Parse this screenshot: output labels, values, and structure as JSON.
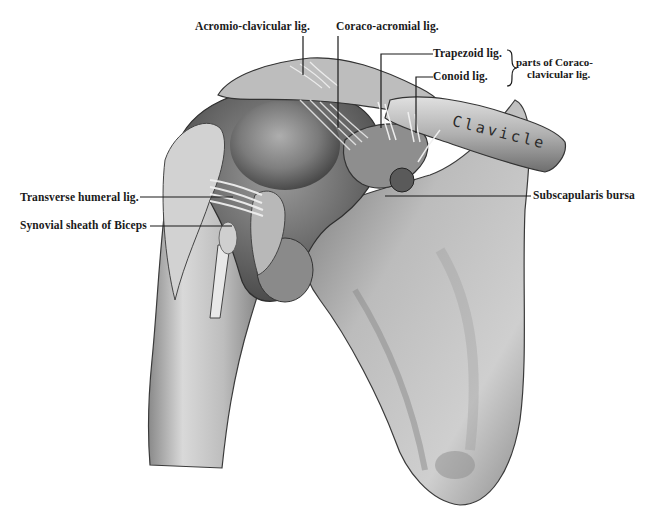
{
  "figure": {
    "colors": {
      "background": "#ffffff",
      "ink": "#1a1a1a",
      "bone_light": "#d8d8d8",
      "bone_mid": "#9a9a9a",
      "bone_dark": "#4a4a4a"
    },
    "labels": {
      "acromio_clavicular": "Acromio-clavicular lig.",
      "coraco_acromial": "Coraco-acromial lig.",
      "trapezoid": "Trapezoid  lig.",
      "conoid": "Conoid lig.",
      "coracoclavicular_line1": "parts of Coraco-",
      "coracoclavicular_line2": "clavicular lig.",
      "transverse_humeral": "Transverse humeral lig.",
      "synovial_sheath": "Synovial sheath of Biceps",
      "subscapularis_bursa": "Subscapularis bursa",
      "clavicle": "Clavicle"
    }
  }
}
